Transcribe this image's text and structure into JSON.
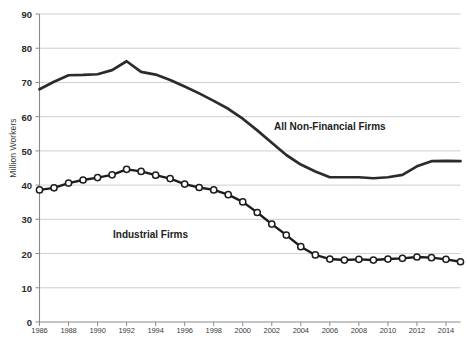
{
  "chart_data": {
    "type": "line",
    "title": "",
    "xlabel": "",
    "ylabel": "Million Workers",
    "ylim": [
      0,
      90
    ],
    "ytick_step": 10,
    "yticks": [
      0,
      10,
      20,
      30,
      40,
      50,
      60,
      70,
      80,
      90
    ],
    "xlim": [
      1986,
      2015
    ],
    "xticks": [
      1986,
      1988,
      1990,
      1992,
      1994,
      1996,
      1998,
      2000,
      2002,
      2004,
      2006,
      2008,
      2010,
      2012,
      2014
    ],
    "grid": "horizontal",
    "legend_position": "inline-annotations",
    "x": [
      1986,
      1987,
      1988,
      1989,
      1990,
      1991,
      1992,
      1993,
      1994,
      1995,
      1996,
      1997,
      1998,
      1999,
      2000,
      2001,
      2002,
      2003,
      2004,
      2005,
      2006,
      2007,
      2008,
      2009,
      2010,
      2011,
      2012,
      2013,
      2014,
      2015
    ],
    "series": [
      {
        "name": "All Non-Financial Firms",
        "color": "#2b2b2b",
        "marker": "none",
        "values": [
          68.0,
          70.2,
          72.1,
          72.2,
          72.4,
          73.6,
          76.2,
          73.1,
          72.3,
          70.7,
          68.8,
          66.8,
          64.6,
          62.3,
          59.4,
          56.0,
          52.4,
          48.8,
          46.0,
          44.0,
          42.3,
          42.3,
          42.3,
          42.0,
          42.3,
          43.0,
          45.5,
          47.0,
          47.1,
          47.0
        ]
      },
      {
        "name": "Industrial Firms",
        "color": "#1d1d1d",
        "marker": "open-circle",
        "values": [
          38.6,
          39.2,
          40.6,
          41.5,
          42.2,
          43.0,
          44.6,
          44.0,
          42.9,
          41.9,
          40.3,
          39.3,
          38.6,
          37.2,
          35.1,
          32.0,
          28.6,
          25.4,
          22.0,
          19.6,
          18.4,
          18.1,
          18.3,
          18.1,
          18.4,
          18.6,
          19.0,
          18.8,
          18.3,
          17.6
        ]
      }
    ],
    "annotations": [
      {
        "text": "All Non-Financial Firms",
        "x": 2005,
        "y": 57
      },
      {
        "text": "Industrial Firms",
        "x": 1993,
        "y": 27
      }
    ]
  },
  "labels": {
    "y_axis_title": "Million Workers",
    "series_all": "All Non-Financial Firms",
    "series_industrial": "Industrial Firms"
  },
  "caption": ""
}
